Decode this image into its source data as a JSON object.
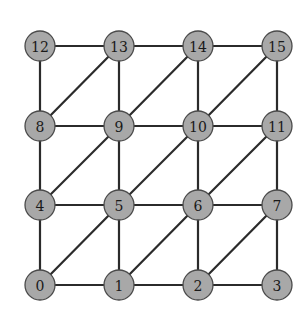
{
  "diagram": {
    "type": "graph",
    "node_style": {
      "fill": "#a8a8a8",
      "stroke": "#4a4a4a",
      "radius": 15
    },
    "edge_color": "#2b2b2b",
    "nodes": [
      {
        "id": "0",
        "label": "0",
        "x": 40,
        "y": 285
      },
      {
        "id": "1",
        "label": "1",
        "x": 119,
        "y": 285
      },
      {
        "id": "2",
        "label": "2",
        "x": 198,
        "y": 285
      },
      {
        "id": "3",
        "label": "3",
        "x": 277,
        "y": 285
      },
      {
        "id": "4",
        "label": "4",
        "x": 40,
        "y": 205
      },
      {
        "id": "5",
        "label": "5",
        "x": 119,
        "y": 205
      },
      {
        "id": "6",
        "label": "6",
        "x": 198,
        "y": 205
      },
      {
        "id": "7",
        "label": "7",
        "x": 277,
        "y": 205
      },
      {
        "id": "8",
        "label": "8",
        "x": 40,
        "y": 126
      },
      {
        "id": "9",
        "label": "9",
        "x": 119,
        "y": 126
      },
      {
        "id": "10",
        "label": "10",
        "x": 198,
        "y": 126
      },
      {
        "id": "11",
        "label": "11",
        "x": 277,
        "y": 126
      },
      {
        "id": "12",
        "label": "12",
        "x": 40,
        "y": 46
      },
      {
        "id": "13",
        "label": "13",
        "x": 119,
        "y": 46
      },
      {
        "id": "14",
        "label": "14",
        "x": 198,
        "y": 46
      },
      {
        "id": "15",
        "label": "15",
        "x": 277,
        "y": 46
      }
    ],
    "edges": [
      [
        "0",
        "1"
      ],
      [
        "1",
        "2"
      ],
      [
        "2",
        "3"
      ],
      [
        "4",
        "5"
      ],
      [
        "5",
        "6"
      ],
      [
        "6",
        "7"
      ],
      [
        "8",
        "9"
      ],
      [
        "9",
        "10"
      ],
      [
        "10",
        "11"
      ],
      [
        "12",
        "13"
      ],
      [
        "13",
        "14"
      ],
      [
        "14",
        "15"
      ],
      [
        "0",
        "4"
      ],
      [
        "4",
        "8"
      ],
      [
        "8",
        "12"
      ],
      [
        "1",
        "5"
      ],
      [
        "5",
        "9"
      ],
      [
        "9",
        "13"
      ],
      [
        "2",
        "6"
      ],
      [
        "6",
        "10"
      ],
      [
        "10",
        "14"
      ],
      [
        "3",
        "7"
      ],
      [
        "7",
        "11"
      ],
      [
        "11",
        "15"
      ],
      [
        "0",
        "5"
      ],
      [
        "1",
        "6"
      ],
      [
        "2",
        "7"
      ],
      [
        "4",
        "9"
      ],
      [
        "5",
        "10"
      ],
      [
        "6",
        "11"
      ],
      [
        "8",
        "13"
      ],
      [
        "9",
        "14"
      ],
      [
        "10",
        "15"
      ]
    ]
  }
}
